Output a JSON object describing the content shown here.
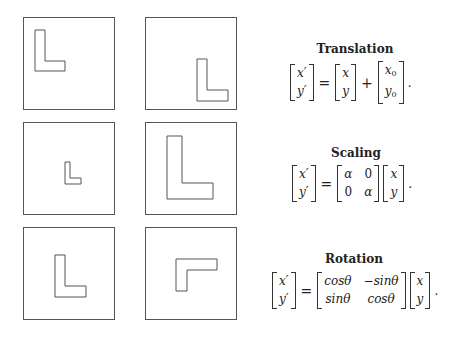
{
  "panels": [
    {
      "id": "translation-before",
      "left": 23,
      "top": 17,
      "shape": "L",
      "points": "11,12 21,12 21,43 41,43 41,53 11,53"
    },
    {
      "id": "translation-after",
      "left": 145,
      "top": 17,
      "shape": "L",
      "points": "51,41 61,41 61,72 82,72 82,83 51,83"
    },
    {
      "id": "scaling-before",
      "left": 23,
      "top": 122,
      "shape": "L-small",
      "points": "41,39 46,39 46,55 57,55 57,61 41,61"
    },
    {
      "id": "scaling-after",
      "left": 145,
      "top": 122,
      "shape": "L-large",
      "points": "21,13 36,13 36,60 67,60 67,76 21,76"
    },
    {
      "id": "rotation-before",
      "left": 23,
      "top": 227,
      "shape": "L",
      "points": "31,27 41,27 41,58 62,58 62,69 31,69"
    },
    {
      "id": "rotation-after",
      "left": 145,
      "top": 227,
      "shape": "L-rotated",
      "points": "30,31 71,31 71,42 41,42 41,63 30,63"
    }
  ],
  "sections": {
    "translation": {
      "title": "Translation",
      "lhs": [
        "x′",
        "y′"
      ],
      "eq": "=",
      "m1": [
        "x",
        "y"
      ],
      "op": "+",
      "m2": [
        "x",
        "0",
        "y",
        "0"
      ],
      "end": "."
    },
    "scaling": {
      "title": "Scaling",
      "lhs": [
        "x′",
        "y′"
      ],
      "eq": "=",
      "m1": [
        "α",
        "0",
        "0",
        "α"
      ],
      "m2": [
        "x",
        "y"
      ],
      "end": "."
    },
    "rotation": {
      "title": "Rotation",
      "lhs": [
        "x′",
        "y′"
      ],
      "eq": "=",
      "m1": [
        "cosθ",
        "−sinθ",
        "sinθ",
        "cosθ"
      ],
      "m2": [
        "x",
        "y"
      ],
      "end": "."
    }
  },
  "colors": {
    "stroke": "#555555",
    "text": "#222222",
    "background": "#ffffff"
  }
}
